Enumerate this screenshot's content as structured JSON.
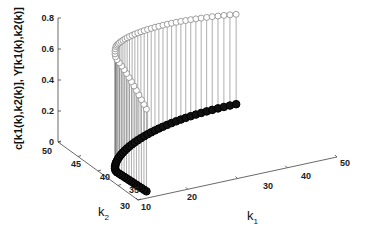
{
  "chart_data": {
    "type": "scatter3d-stem",
    "title": "",
    "xlabel": "k1",
    "ylabel": "k2",
    "zlabel": "c[k1(k),k2(k)], Y[k1(k),k2(k)]",
    "xlim": [
      10,
      50
    ],
    "ylim": [
      30,
      50
    ],
    "zlim": [
      0,
      0.8
    ],
    "xticks": [
      "10",
      "20",
      "30",
      "40",
      "50"
    ],
    "yticks": [
      "30",
      "35",
      "40",
      "45",
      "50"
    ],
    "zticks": [
      "0",
      "0.2",
      "0.4",
      "0.6",
      "0.8"
    ],
    "grid": false,
    "series": [
      {
        "name": "Y[k1(k),k2(k)]",
        "marker": "open-circle",
        "color": "#888888",
        "description": "upper trajectory, Y values ~0.55-0.8"
      },
      {
        "name": "c[k1(k),k2(k)]",
        "marker": "filled-circle",
        "color": "#111111",
        "description": "lower trajectory at z~0"
      }
    ],
    "trajectory": {
      "k1_start": 12,
      "k2_start": 31,
      "k1_min": 12,
      "k2_turn": 45,
      "k1_end": 45,
      "k2_end": 49,
      "Y_start": 0.55,
      "Y_peak": 0.77,
      "Y_end": 0.6,
      "c_value": 0.02,
      "points": 50
    }
  },
  "axes": {
    "z_tick_labels": [
      "0",
      "0.2",
      "0.4",
      "0.6",
      "0.8"
    ],
    "k2_tick_labels": [
      "50",
      "45",
      "40",
      "35",
      "30"
    ],
    "k1_tick_labels": [
      "10",
      "20",
      "30",
      "40",
      "50"
    ],
    "z_label": "c[k1(k),k2(k)], Y[k1(k),k2(k)]",
    "k1_label": "k",
    "k1_sub": "1",
    "k2_label": "k",
    "k2_sub": "2"
  }
}
